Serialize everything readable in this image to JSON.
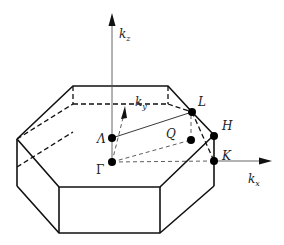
{
  "diagram": {
    "axes": [
      {
        "id": "kz",
        "label": "k",
        "subscript": "z"
      },
      {
        "id": "ky",
        "label": "k",
        "subscript": "y"
      },
      {
        "id": "kx",
        "label": "k",
        "subscript": "x"
      }
    ],
    "points": [
      {
        "id": "Gamma",
        "label": "Γ"
      },
      {
        "id": "Lambda",
        "label": "Λ"
      },
      {
        "id": "L",
        "label": "L"
      },
      {
        "id": "H",
        "label": "H"
      },
      {
        "id": "K",
        "label": "K"
      },
      {
        "id": "Q",
        "label": "Q"
      }
    ],
    "colors": {
      "line": "#111111",
      "axis": "#555555",
      "point": "#000000"
    }
  }
}
